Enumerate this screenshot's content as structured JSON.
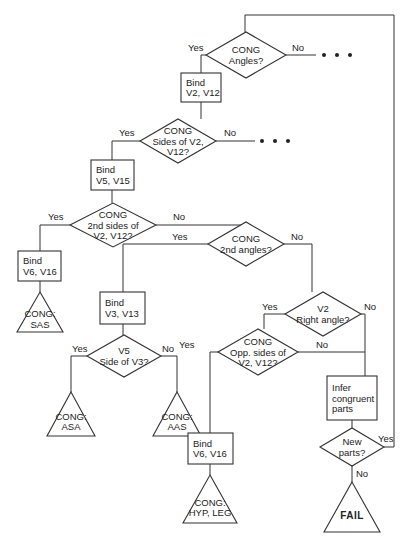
{
  "diagram": {
    "title": "",
    "nodes": [
      {
        "id": "d_angles",
        "type": "decision",
        "cx": 246,
        "cy": 55,
        "w": 80,
        "h": 46,
        "lines": [
          "CONG",
          "Angles?"
        ]
      },
      {
        "id": "p_bind_v2",
        "type": "process",
        "x": 181,
        "y": 73,
        "w": 40,
        "h": 29,
        "lines": [
          "Bind",
          "V2, V12"
        ]
      },
      {
        "id": "d_sides",
        "type": "decision",
        "cx": 178,
        "cy": 141,
        "w": 76,
        "h": 44,
        "lines": [
          "CONG",
          "Sides of V2,",
          "V12?"
        ]
      },
      {
        "id": "p_bind_v5",
        "type": "process",
        "x": 91,
        "y": 160,
        "w": 43,
        "h": 30,
        "lines": [
          "Bind",
          "V5, V15"
        ]
      },
      {
        "id": "d_2nd_sides",
        "type": "decision",
        "cx": 113,
        "cy": 225,
        "w": 86,
        "h": 44,
        "lines": [
          "CONG",
          "2nd sides of",
          "V2, V12?"
        ]
      },
      {
        "id": "p_bind_v6a",
        "type": "process",
        "x": 18,
        "y": 251,
        "w": 43,
        "h": 30,
        "lines": [
          "Bind",
          "V6, V16"
        ]
      },
      {
        "id": "t_sas",
        "type": "terminal",
        "cx": 40,
        "cy": 312,
        "w": 46,
        "h": 40,
        "lines": [
          "CONG:",
          "SAS"
        ]
      },
      {
        "id": "d_2nd_angles",
        "type": "decision",
        "cx": 246,
        "cy": 244,
        "w": 76,
        "h": 44,
        "lines": [
          "CONG",
          "2nd angles?"
        ]
      },
      {
        "id": "p_bind_v3",
        "type": "process",
        "x": 100,
        "y": 292,
        "w": 45,
        "h": 32,
        "lines": [
          "Bind",
          "V3, V13"
        ]
      },
      {
        "id": "d_v5_side",
        "type": "decision",
        "cx": 124,
        "cy": 356,
        "w": 74,
        "h": 42,
        "lines": [
          "V5",
          "Side of V3?"
        ]
      },
      {
        "id": "t_asa",
        "type": "terminal",
        "cx": 71,
        "cy": 414,
        "w": 48,
        "h": 44,
        "lines": [
          "CONG:",
          "ASA"
        ]
      },
      {
        "id": "t_aas",
        "type": "terminal",
        "cx": 177,
        "cy": 414,
        "w": 48,
        "h": 44,
        "lines": [
          "CONG:",
          "AAS"
        ]
      },
      {
        "id": "d_right_angle",
        "type": "decision",
        "cx": 323,
        "cy": 314,
        "w": 76,
        "h": 44,
        "lines": [
          "V2",
          "Right angle?"
        ]
      },
      {
        "id": "d_opp_sides",
        "type": "decision",
        "cx": 258,
        "cy": 352,
        "w": 80,
        "h": 46,
        "lines": [
          "CONG",
          "Opp. sides of",
          "V2, V12?"
        ]
      },
      {
        "id": "p_infer",
        "type": "process",
        "x": 327,
        "y": 376,
        "w": 50,
        "h": 44,
        "lines": [
          "Infer",
          "congruent",
          "parts"
        ]
      },
      {
        "id": "p_bind_v6b",
        "type": "process",
        "x": 188,
        "y": 433,
        "w": 45,
        "h": 31,
        "lines": [
          "Bind",
          "V6, V16"
        ]
      },
      {
        "id": "t_hyp_leg",
        "type": "terminal",
        "cx": 210,
        "cy": 499,
        "w": 54,
        "h": 48,
        "lines": [
          "CONG:",
          "HYP, LEG"
        ]
      },
      {
        "id": "d_new_parts",
        "type": "decision",
        "cx": 352,
        "cy": 447,
        "w": 64,
        "h": 38,
        "lines": [
          "New",
          "parts?"
        ]
      },
      {
        "id": "t_fail",
        "type": "terminal",
        "cx": 352,
        "cy": 507,
        "w": 56,
        "h": 50,
        "lines": [
          "FAIL"
        ]
      }
    ],
    "edges": [
      {
        "points": [
          [
            207,
            55
          ],
          [
            210,
            55
          ]
        ],
        "label": "",
        "lx": 0,
        "ly": 0
      },
      {
        "points": [
          [
            206,
            55
          ],
          [
            201,
            55
          ],
          [
            201,
            73
          ]
        ],
        "label": "Yes",
        "lx": 188,
        "ly": 51
      },
      {
        "points": [
          [
            286,
            55
          ],
          [
            316,
            55
          ]
        ],
        "label": "No",
        "lx": 292,
        "ly": 51
      },
      {
        "points": [
          [
            201,
            102
          ],
          [
            201,
            119
          ]
        ],
        "label": "",
        "lx": 0,
        "ly": 0
      },
      {
        "points": [
          [
            140,
            141
          ],
          [
            112,
            141
          ],
          [
            112,
            160
          ]
        ],
        "label": "Yes",
        "lx": 119,
        "ly": 136
      },
      {
        "points": [
          [
            216,
            141
          ],
          [
            255,
            141
          ]
        ],
        "label": "No",
        "lx": 224,
        "ly": 136
      },
      {
        "points": [
          [
            112,
            190
          ],
          [
            112,
            203
          ]
        ],
        "label": "",
        "lx": 0,
        "ly": 0
      },
      {
        "points": [
          [
            70,
            225
          ],
          [
            40,
            225
          ],
          [
            40,
            251
          ]
        ],
        "label": "Yes",
        "lx": 48,
        "ly": 220
      },
      {
        "points": [
          [
            156,
            225
          ],
          [
            246,
            225
          ],
          [
            246,
            222
          ]
        ],
        "label": "No",
        "lx": 173,
        "ly": 220
      },
      {
        "points": [
          [
            40,
            281
          ],
          [
            40,
            292
          ]
        ],
        "label": "",
        "lx": 0,
        "ly": 0
      },
      {
        "points": [
          [
            208,
            244
          ],
          [
            123,
            244
          ],
          [
            123,
            292
          ]
        ],
        "label": "Yes",
        "lx": 172,
        "ly": 240
      },
      {
        "points": [
          [
            284,
            244
          ],
          [
            312,
            244
          ],
          [
            312,
            292
          ]
        ],
        "label": "No",
        "lx": 291,
        "ly": 240
      },
      {
        "points": [
          [
            123,
            324
          ],
          [
            123,
            335
          ]
        ],
        "label": "",
        "lx": 0,
        "ly": 0
      },
      {
        "points": [
          [
            87,
            356
          ],
          [
            71,
            356
          ],
          [
            71,
            392
          ]
        ],
        "label": "Yes",
        "lx": 72,
        "ly": 352
      },
      {
        "points": [
          [
            161,
            356
          ],
          [
            177,
            356
          ],
          [
            177,
            392
          ]
        ],
        "label": "No",
        "lx": 162,
        "ly": 352
      },
      {
        "points": [
          [
            285,
            314
          ],
          [
            264,
            314
          ],
          [
            264,
            329
          ]
        ],
        "label": "Yes",
        "lx": 262,
        "ly": 310
      },
      {
        "points": [
          [
            361,
            314
          ],
          [
            365,
            314
          ],
          [
            365,
            376
          ]
        ],
        "label": "No",
        "lx": 364,
        "ly": 310
      },
      {
        "points": [
          [
            298,
            352
          ],
          [
            365,
            352
          ]
        ],
        "label": "No",
        "lx": 316,
        "ly": 348
      },
      {
        "points": [
          [
            218,
            352
          ],
          [
            210,
            352
          ],
          [
            210,
            433
          ]
        ],
        "label": "Yes",
        "lx": 179,
        "ly": 348
      },
      {
        "points": [
          [
            210,
            464
          ],
          [
            210,
            475
          ]
        ],
        "label": "",
        "lx": 0,
        "ly": 0
      },
      {
        "points": [
          [
            352,
            420
          ],
          [
            352,
            428
          ]
        ],
        "label": "",
        "lx": 0,
        "ly": 0
      },
      {
        "points": [
          [
            384,
            447
          ],
          [
            394,
            447
          ],
          [
            394,
            15
          ],
          [
            245,
            15
          ],
          [
            245,
            32
          ]
        ],
        "label": "Yes",
        "lx": 378,
        "ly": 442
      },
      {
        "points": [
          [
            352,
            466
          ],
          [
            352,
            482
          ]
        ],
        "label": "No",
        "lx": 356,
        "ly": 477
      }
    ],
    "ellipses": [
      {
        "x": 324,
        "y": 55
      },
      {
        "x": 262,
        "y": 141
      }
    ]
  }
}
